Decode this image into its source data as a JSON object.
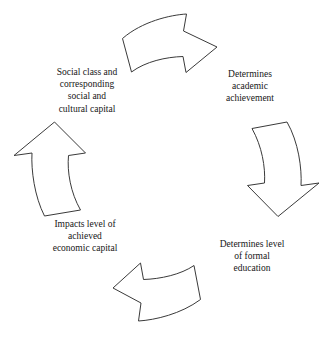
{
  "diagram": {
    "type": "cycle",
    "direction": "clockwise",
    "background_color": "#ffffff",
    "line_color": "#3a3a3a",
    "text_color": "#161616",
    "nodes": [
      {
        "id": "social-capital",
        "position": "top-left",
        "text": "Social  class and\ncorresponding\nsocial and\ncultural capital"
      },
      {
        "id": "academic-achievement",
        "position": "top-right",
        "text": "Determines\nacademic\nachievement"
      },
      {
        "id": "formal-education",
        "position": "bottom-right",
        "text": "Determines level\nof formal\neducation"
      },
      {
        "id": "economic-capital",
        "position": "bottom-left",
        "text": "Impacts level of\nachieved\neconomic capital"
      }
    ],
    "arrows": [
      {
        "id": "arrow-top",
        "name": "curved-arrow-right",
        "from": "social-capital",
        "to": "academic-achievement"
      },
      {
        "id": "arrow-right",
        "name": "curved-arrow-down",
        "from": "academic-achievement",
        "to": "formal-education"
      },
      {
        "id": "arrow-bottom",
        "name": "curved-arrow-left",
        "from": "formal-education",
        "to": "economic-capital"
      },
      {
        "id": "arrow-left",
        "name": "curved-arrow-up",
        "from": "economic-capital",
        "to": "social-capital"
      }
    ]
  }
}
